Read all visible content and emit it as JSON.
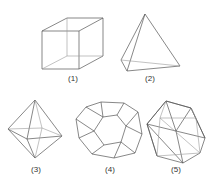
{
  "figure": {
    "solids": [
      {
        "id": 1,
        "name": "cube",
        "label": "(1)"
      },
      {
        "id": 2,
        "name": "tetrahedron",
        "label": "(2)"
      },
      {
        "id": 3,
        "name": "octahedron",
        "label": "(3)"
      },
      {
        "id": 4,
        "name": "dodecahedron",
        "label": "(4)"
      },
      {
        "id": 5,
        "name": "icosahedron",
        "label": "(5)"
      }
    ],
    "line_color": "#555555",
    "background": "#ffffff"
  }
}
